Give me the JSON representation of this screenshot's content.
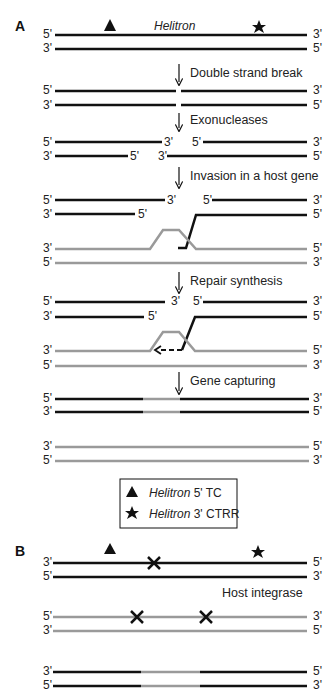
{
  "panels": {
    "A": {
      "label": "A",
      "title": "Helitron",
      "steps": [
        {
          "label": "Double strand break"
        },
        {
          "label": "Exonucleases"
        },
        {
          "label": "Invasion in a host gene"
        },
        {
          "label": "Repair synthesis"
        },
        {
          "label": "Gene capturing"
        }
      ]
    },
    "B": {
      "label": "B",
      "step": "Host integrase"
    }
  },
  "strand_ends": {
    "five": "5'",
    "three": "3'"
  },
  "legend": {
    "items": [
      {
        "symbol": "triangle",
        "name": "Helitron",
        "suffix": " 5' TC"
      },
      {
        "symbol": "star",
        "name": "Helitron",
        "suffix": " 3' CTRR"
      }
    ]
  },
  "colors": {
    "helitron_strand": "#111111",
    "host_strand": "#9a9a9a"
  }
}
